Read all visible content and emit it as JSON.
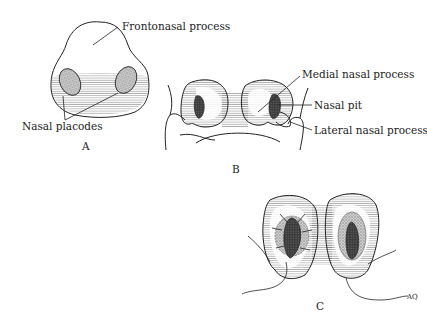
{
  "figure": {
    "panels": [
      {
        "id": "A",
        "label": "A",
        "annotations": [
          "Frontonasal process",
          "Nasal placodes"
        ]
      },
      {
        "id": "B",
        "label": "B",
        "annotations": [
          "Medial nasal process",
          "Nasal pit",
          "Lateral nasal process"
        ]
      },
      {
        "id": "C",
        "label": "C",
        "annotations": []
      }
    ],
    "labels": {
      "frontonasal_process": "Frontonasal process",
      "nasal_placodes": "Nasal placodes",
      "medial_nasal_process": "Medial nasal process",
      "nasal_pit": "Nasal pit",
      "lateral_nasal_process": "Lateral nasal process",
      "panel_a": "A",
      "panel_b": "B",
      "panel_c": "C",
      "signature": "AQ"
    },
    "colors": {
      "ink": "#222222",
      "pit": "#333333",
      "placode": "#9a9a9a",
      "background": "#ffffff"
    }
  }
}
